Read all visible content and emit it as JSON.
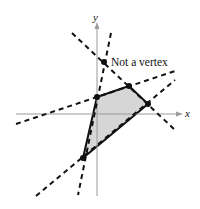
{
  "figure": {
    "axes": {
      "x_label": "x",
      "y_label": "y",
      "color": "#9a9a9a"
    },
    "region": {
      "fill": "#d6d6d6",
      "stroke": "#111111",
      "vertices": [
        [
          97,
          97
        ],
        [
          129,
          86
        ],
        [
          148,
          104
        ],
        [
          83,
          158
        ]
      ]
    },
    "boundary_lines": [
      {
        "name": "line-1",
        "from": [
          72,
          33
        ],
        "to": [
          175,
          130
        ]
      },
      {
        "name": "line-2",
        "from": [
          16,
          124
        ],
        "to": [
          175,
          71
        ]
      },
      {
        "name": "line-3",
        "from": [
          111,
          33
        ],
        "to": [
          78,
          195
        ]
      },
      {
        "name": "line-4",
        "from": [
          36,
          196
        ],
        "to": [
          175,
          80
        ]
      }
    ],
    "vertex_points": [
      [
        97,
        97
      ],
      [
        129,
        86
      ],
      [
        148,
        104
      ],
      [
        83,
        158
      ]
    ],
    "non_vertex_point": {
      "x": 104,
      "y": 62,
      "label": "Not a vertex"
    },
    "dash_color": "#111111"
  }
}
